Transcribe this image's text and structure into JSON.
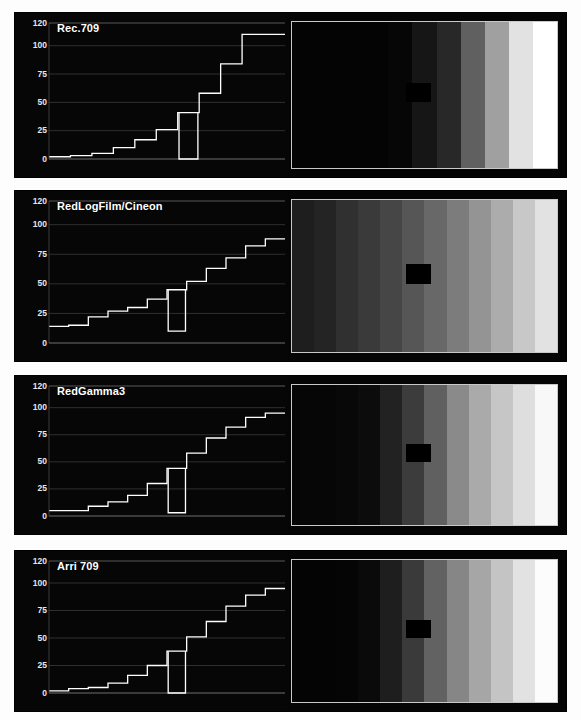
{
  "figure": {
    "background_color": "#fdfdfd",
    "panel_background": "#050505",
    "trace_color": "#ffffff",
    "grid_color": "#3a3a3a",
    "axis_label_color": "#e8e8e8",
    "patch_color": "#000000",
    "ramp_border_color": "#c9c9ca"
  },
  "axis": {
    "y_ticks": [
      120,
      100,
      75,
      50,
      25,
      0
    ],
    "y_tick_labels": [
      "120",
      "100",
      "75",
      "50",
      "25",
      "0"
    ],
    "ylim": [
      0,
      120
    ],
    "grid": true,
    "x_ticks": []
  },
  "panels": [
    {
      "title": "Rec.709",
      "waveform_values": [
        2,
        3,
        5,
        10,
        17,
        26,
        41,
        58,
        84,
        110,
        110
      ],
      "notch": {
        "step_index": 6,
        "value": 0
      },
      "ramp_levels": [
        4,
        4,
        4,
        4,
        6,
        22,
        40,
        96,
        160,
        226,
        255
      ],
      "patch_position": {
        "x_pct": 43,
        "y_pct": 42
      }
    },
    {
      "title": "RedLogFilm/Cineon",
      "waveform_values": [
        14,
        15,
        22,
        27,
        30,
        37,
        45,
        52,
        63,
        72,
        82,
        88
      ],
      "notch": {
        "step_index": 6,
        "value": 10
      },
      "ramp_levels": [
        30,
        36,
        48,
        58,
        70,
        86,
        104,
        124,
        148,
        172,
        200,
        226
      ],
      "patch_position": {
        "x_pct": 43,
        "y_pct": 42
      }
    },
    {
      "title": "RedGamma3",
      "waveform_values": [
        5,
        5,
        9,
        13,
        19,
        30,
        44,
        58,
        72,
        82,
        91,
        95
      ],
      "notch": {
        "step_index": 6,
        "value": 3
      },
      "ramp_levels": [
        6,
        6,
        8,
        12,
        34,
        60,
        96,
        138,
        170,
        198,
        222,
        248
      ],
      "patch_position": {
        "x_pct": 43,
        "y_pct": 42
      }
    },
    {
      "title": "Arri 709",
      "waveform_values": [
        2,
        4,
        5,
        9,
        16,
        25,
        38,
        51,
        65,
        79,
        89,
        95
      ],
      "notch": {
        "step_index": 6,
        "value": 0
      },
      "ramp_levels": [
        4,
        4,
        5,
        10,
        30,
        58,
        98,
        134,
        166,
        196,
        226,
        252
      ],
      "patch_position": {
        "x_pct": 43,
        "y_pct": 42
      }
    }
  ],
  "chart_data": {
    "type": "line",
    "subtitle": "",
    "xlabel": "",
    "ylabel": "IRE",
    "ylim": [
      0,
      120
    ],
    "grid": true,
    "legend_position": "none",
    "annotations": [
      "Each panel shows a stepped grey-scale waveform trace plus the corresponding grey ramp image",
      "A black notch patch is superimposed over one mid-grey step in every ramp"
    ],
    "categories": [
      "step1",
      "step2",
      "step3",
      "step4",
      "step5",
      "step6",
      "step7",
      "step8",
      "step9",
      "step10",
      "step11",
      "step12"
    ],
    "series": [
      {
        "name": "Rec.709",
        "values": [
          2,
          3,
          5,
          10,
          17,
          26,
          41,
          58,
          84,
          110,
          110,
          null
        ]
      },
      {
        "name": "RedLogFilm/Cineon",
        "values": [
          14,
          15,
          22,
          27,
          30,
          37,
          45,
          52,
          63,
          72,
          82,
          88
        ]
      },
      {
        "name": "RedGamma3",
        "values": [
          5,
          5,
          9,
          13,
          19,
          30,
          44,
          58,
          72,
          82,
          91,
          95
        ]
      },
      {
        "name": "Arri 709",
        "values": [
          2,
          4,
          5,
          9,
          16,
          25,
          38,
          51,
          65,
          79,
          89,
          95
        ]
      }
    ]
  }
}
